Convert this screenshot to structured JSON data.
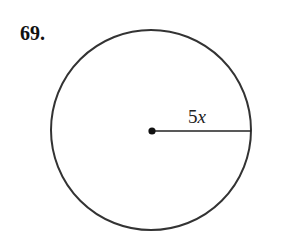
{
  "problem": {
    "number": "69."
  },
  "figure": {
    "shape": "circle",
    "radius_label": {
      "coefficient": "5",
      "variable": "x"
    },
    "stroke_color": "#333333"
  }
}
